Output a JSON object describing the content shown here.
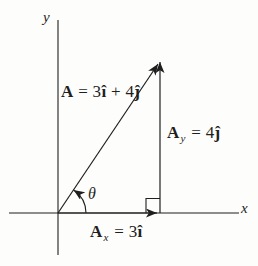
{
  "figure": {
    "ink_color": "#1f1f1f",
    "background_color": "#fdfdfb",
    "axes": {
      "x_label": "x",
      "y_label": "y"
    },
    "angle": {
      "label": "θ"
    },
    "vector_a": {
      "symbol": "A",
      "eq": " = 3",
      "i_hat": "î",
      "plus": " + 4",
      "j_hat": "ĵ"
    },
    "component_y": {
      "symbol": "A",
      "subscript": "y",
      "eq": " = 4",
      "j_hat": "ĵ"
    },
    "component_x": {
      "symbol": "A",
      "subscript": "x",
      "eq": " = 3",
      "i_hat": "î"
    }
  }
}
